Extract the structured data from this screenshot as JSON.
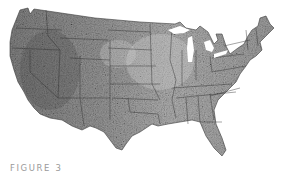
{
  "figure": {
    "caption": "FIGURE 3"
  },
  "map": {
    "subject": "Contiguous United States",
    "style": "grayscale raster with state boundaries",
    "colors": {
      "background": "#ffffff",
      "land_light": "#c8c8c8",
      "land_mid": "#8c8c8c",
      "land_dark": "#4a4a4a",
      "boundary": "#2a2a2a",
      "caption": "#9a9a9a"
    }
  }
}
